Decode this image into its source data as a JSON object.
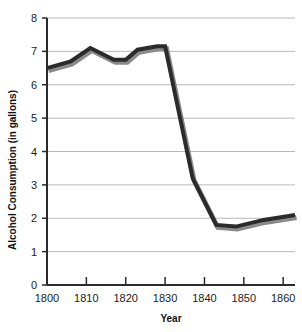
{
  "chart_data": {
    "type": "line",
    "title": "",
    "xlabel": "Year",
    "ylabel": "Alcohol Consumption (in gallons)",
    "xlim": [
      1800,
      1863
    ],
    "ylim": [
      0,
      8
    ],
    "grid": true,
    "legend": false,
    "line_color": "#2b2b2b",
    "shadow_color": "#8a8a8a",
    "x_ticks": [
      1800,
      1810,
      1820,
      1830,
      1840,
      1850,
      1860
    ],
    "x_tick_labels": [
      "1800",
      "1810",
      "1820",
      "1830",
      "1840",
      "1850",
      "1860"
    ],
    "y_ticks": [
      0,
      1,
      2,
      3,
      4,
      5,
      6,
      7,
      8
    ],
    "y_tick_labels": [
      "0",
      "1",
      "2",
      "3",
      "4",
      "5",
      "6",
      "7",
      "8"
    ],
    "series": [
      {
        "name": "Alcohol Consumption",
        "x": [
          1800,
          1806,
          1811,
          1817,
          1820,
          1823,
          1828,
          1830,
          1837,
          1843,
          1848,
          1855,
          1863
        ],
        "values": [
          6.5,
          6.7,
          7.1,
          6.75,
          6.75,
          7.05,
          7.15,
          7.15,
          3.2,
          1.8,
          1.75,
          1.95,
          2.1
        ]
      }
    ]
  },
  "axis": {
    "y_title": "Alcohol Consumption (in gallons)",
    "x_title": "Year"
  }
}
